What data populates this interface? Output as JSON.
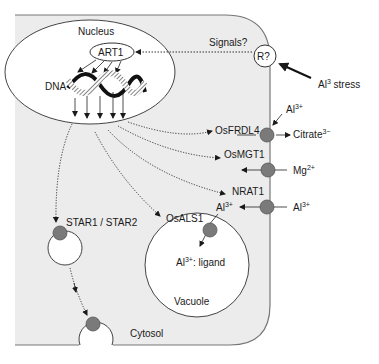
{
  "diagram": {
    "compartments": {
      "nucleus": "Nucleus",
      "vacuole": "Vacuole",
      "cytosol": "Cytosol"
    },
    "nucleus_contents": {
      "regulator": "ART1",
      "dna": "DNA"
    },
    "receptor": {
      "label": "R?",
      "signal_label": "Signals?",
      "stress_label": "Al",
      "stress_sup": "3",
      "stress_suffix": " stress"
    },
    "transporters": [
      {
        "name": "OsFRDL4",
        "substrate_in": "Al",
        "substrate_in_sup": "3+",
        "substrate_out": "Citrate",
        "substrate_out_sup": "3−"
      },
      {
        "name": "OsMGT1",
        "substrate": "Mg",
        "substrate_sup": "2+"
      },
      {
        "name": "NRAT1",
        "substrate": "Al",
        "substrate_sup": "3+"
      },
      {
        "name": "OsALS1",
        "substrate": "Al",
        "substrate_sup": "3+"
      },
      {
        "name": "STAR1 / STAR2"
      }
    ],
    "vacuole_contents": {
      "complex": "Al",
      "complex_sup": "3+",
      "complex_suffix": ": ligand"
    },
    "colors": {
      "cell_fill": "#ececec",
      "cell_stroke": "#777777",
      "transporter_fill": "#7a7a7a",
      "line": "#222222"
    }
  }
}
